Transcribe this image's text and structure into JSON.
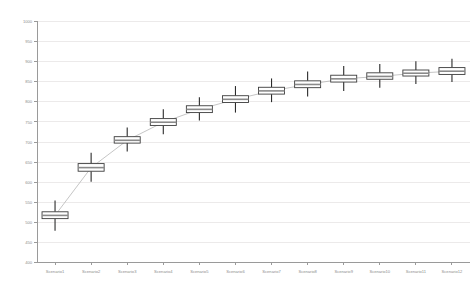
{
  "chart_data": {
    "type": "box",
    "title": "",
    "xlabel": "",
    "ylabel": "",
    "ylim": [
      400,
      1000
    ],
    "ytick_step": 50,
    "grid": true,
    "legend": null,
    "yticks": [
      400,
      450,
      500,
      550,
      600,
      650,
      700,
      750,
      800,
      850,
      900,
      950,
      1000
    ],
    "categories": [
      "Scenario1",
      "Scenario2",
      "Scenario3",
      "Scenario4",
      "Scenario5",
      "Scenario6",
      "Scenario7",
      "Scenario8",
      "Scenario9",
      "Scenario10",
      "Scenario11",
      "Scenario12"
    ],
    "boxes": [
      {
        "label": "Scenario1",
        "min": 478,
        "q1": 508,
        "median": 516,
        "q3": 525,
        "max": 553
      },
      {
        "label": "Scenario2",
        "min": 600,
        "q1": 626,
        "median": 635,
        "q3": 645,
        "max": 672
      },
      {
        "label": "Scenario3",
        "min": 675,
        "q1": 696,
        "median": 703,
        "q3": 712,
        "max": 735
      },
      {
        "label": "Scenario4",
        "min": 718,
        "q1": 740,
        "median": 748,
        "q3": 757,
        "max": 780
      },
      {
        "label": "Scenario5",
        "min": 752,
        "q1": 772,
        "median": 780,
        "q3": 789,
        "max": 810
      },
      {
        "label": "Scenario6",
        "min": 772,
        "q1": 797,
        "median": 805,
        "q3": 814,
        "max": 838
      },
      {
        "label": "Scenario7",
        "min": 798,
        "q1": 818,
        "median": 826,
        "q3": 835,
        "max": 857
      },
      {
        "label": "Scenario8",
        "min": 812,
        "q1": 834,
        "median": 842,
        "q3": 851,
        "max": 874
      },
      {
        "label": "Scenario9",
        "min": 826,
        "q1": 848,
        "median": 856,
        "q3": 865,
        "max": 888
      },
      {
        "label": "Scenario10",
        "min": 834,
        "q1": 855,
        "median": 862,
        "q3": 871,
        "max": 893
      },
      {
        "label": "Scenario11",
        "min": 843,
        "q1": 863,
        "median": 870,
        "q3": 878,
        "max": 900
      },
      {
        "label": "Scenario12",
        "min": 848,
        "q1": 867,
        "median": 875,
        "q3": 884,
        "max": 906
      }
    ],
    "trend_values": [
      516,
      635,
      703,
      748,
      780,
      805,
      826,
      842,
      856,
      862,
      870,
      875
    ],
    "colors": {
      "box_stroke": "#3c3c3c",
      "box_fill": "#ffffff",
      "median": "#8a8a8a",
      "whisker": "#2b2b2b",
      "grid": "#eceaea",
      "axis": "#9a9a9a",
      "tick_text": "#8d8d8d",
      "trend": "#b6b6b6",
      "background": "#ffffff"
    }
  }
}
